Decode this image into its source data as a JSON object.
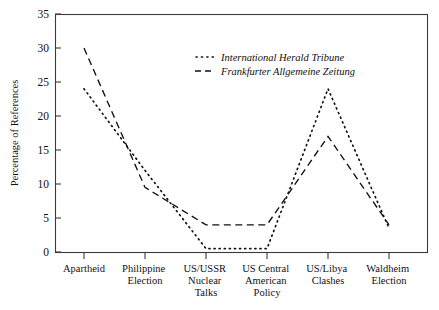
{
  "chart_data": {
    "type": "line",
    "title": "",
    "xlabel": "",
    "ylabel": "Percentage of References",
    "ylim": [
      0,
      35
    ],
    "yticks": [
      0,
      5,
      10,
      15,
      20,
      25,
      30,
      35
    ],
    "grid": false,
    "legend_position": "upper-center",
    "categories": [
      "Apartheid",
      "Philippine Election",
      "US/USSR Nuclear Talks",
      "US Central American Policy",
      "US/Libya Clashes",
      "Waldheim Election"
    ],
    "category_lines": [
      [
        "Apartheid"
      ],
      [
        "Philippine",
        "Election"
      ],
      [
        "US/USSR",
        "Nuclear",
        "Talks"
      ],
      [
        "US Central",
        "American",
        "Policy"
      ],
      [
        "US/Libya",
        "Clashes"
      ],
      [
        "Waldheim",
        "Election"
      ]
    ],
    "series": [
      {
        "name": "International Herald Tribune",
        "style": "dotted",
        "color": "#111111",
        "values": [
          24,
          12,
          0.5,
          0.5,
          24,
          3.5
        ]
      },
      {
        "name": "Frankfurter Allgemeine Zeitung",
        "style": "dashed",
        "color": "#111111",
        "values": [
          30,
          9.5,
          4,
          4,
          17,
          4
        ]
      }
    ]
  },
  "axis": {
    "y_labels": [
      "0",
      "5",
      "10",
      "15",
      "20",
      "25",
      "30",
      "35"
    ],
    "y_title": "Percentage of References"
  },
  "legend": {
    "entries": [
      {
        "label": "International Herald Tribune",
        "marker": "dotted-line-sample"
      },
      {
        "label": "Frankfurter Allgemeine Zeitung",
        "marker": "dashed-line-sample"
      }
    ]
  }
}
